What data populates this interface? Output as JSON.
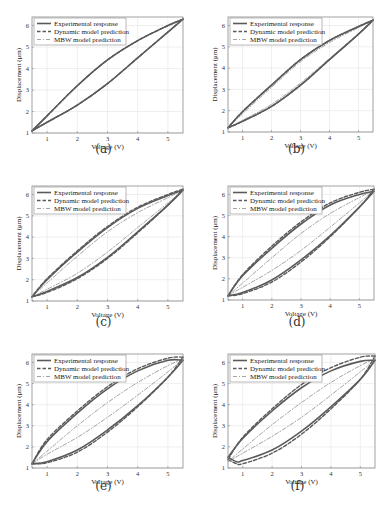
{
  "chart_data": [
    {
      "id": "a",
      "type": "line",
      "caption": "(a)",
      "xlabel": "Voltage (V)",
      "ylabel": "Displacement (μm)",
      "xlim": [
        0.5,
        5.5
      ],
      "ylim": [
        1,
        6.4
      ],
      "xticks": [
        1,
        2,
        3,
        4,
        5
      ],
      "yticks": [
        1,
        2,
        3,
        4,
        5,
        6
      ],
      "grid": true,
      "legend": {
        "position": "top-left",
        "entries": [
          "Experimental response",
          "Dynamic model prediction",
          "MBW model prediction"
        ]
      },
      "series": [
        {
          "name": "Experimental response",
          "style": "solid",
          "ascending": {
            "x": [
              0.5,
              1,
              2,
              3,
              4,
              5,
              5.5
            ],
            "y": [
              1.1,
              1.5,
              2.3,
              3.3,
              4.5,
              5.7,
              6.3
            ]
          },
          "descending": {
            "x": [
              5.5,
              5,
              4,
              3,
              2,
              1,
              0.5
            ],
            "y": [
              6.3,
              6.0,
              5.3,
              4.4,
              3.2,
              1.8,
              1.1
            ]
          }
        },
        {
          "name": "Dynamic model prediction",
          "style": "dashed",
          "ascending": {
            "x": [
              0.5,
              1,
              2,
              3,
              4,
              5,
              5.5
            ],
            "y": [
              1.1,
              1.5,
              2.3,
              3.3,
              4.5,
              5.7,
              6.3
            ]
          },
          "descending": {
            "x": [
              5.5,
              5,
              4,
              3,
              2,
              1,
              0.5
            ],
            "y": [
              6.3,
              6.0,
              5.3,
              4.4,
              3.2,
              1.8,
              1.1
            ]
          }
        },
        {
          "name": "MBW model prediction",
          "style": "dashdot",
          "ascending": {
            "x": [
              0.5,
              1,
              2,
              3,
              4,
              5,
              5.5
            ],
            "y": [
              1.1,
              1.5,
              2.3,
              3.3,
              4.5,
              5.7,
              6.3
            ]
          },
          "descending": {
            "x": [
              5.5,
              5,
              4,
              3,
              2,
              1,
              0.5
            ],
            "y": [
              6.3,
              6.0,
              5.3,
              4.4,
              3.2,
              1.8,
              1.1
            ]
          }
        }
      ]
    },
    {
      "id": "b",
      "type": "line",
      "caption": "(b)",
      "xlabel": "Voltage (V)",
      "ylabel": "Displacement (μm)",
      "xlim": [
        0.5,
        5.5
      ],
      "ylim": [
        1,
        6.4
      ],
      "xticks": [
        1,
        2,
        3,
        4,
        5
      ],
      "yticks": [
        1,
        2,
        3,
        4,
        5,
        6
      ],
      "grid": true,
      "legend": {
        "position": "top-left",
        "entries": [
          "Experimental response",
          "Dynamic model prediction",
          "MBW model prediction"
        ]
      },
      "series": [
        {
          "name": "Experimental response",
          "style": "solid",
          "ascending": {
            "x": [
              0.5,
              1,
              2,
              3,
              4,
              5,
              5.5
            ],
            "y": [
              1.2,
              1.5,
              2.2,
              3.2,
              4.4,
              5.6,
              6.25
            ]
          },
          "descending": {
            "x": [
              5.5,
              5,
              4,
              3,
              2,
              1,
              0.5
            ],
            "y": [
              6.25,
              5.95,
              5.3,
              4.4,
              3.2,
              1.95,
              1.2
            ]
          }
        },
        {
          "name": "Dynamic model prediction",
          "style": "dashed",
          "ascending": {
            "x": [
              0.5,
              1,
              2,
              3,
              4,
              5,
              5.5
            ],
            "y": [
              1.2,
              1.5,
              2.2,
              3.2,
              4.4,
              5.6,
              6.25
            ]
          },
          "descending": {
            "x": [
              5.5,
              5,
              4,
              3,
              2,
              1,
              0.5
            ],
            "y": [
              6.25,
              5.95,
              5.3,
              4.4,
              3.2,
              1.95,
              1.2
            ]
          }
        },
        {
          "name": "MBW model prediction",
          "style": "dashdot",
          "ascending": {
            "x": [
              0.5,
              1,
              2,
              3,
              4,
              5,
              5.5
            ],
            "y": [
              1.2,
              1.55,
              2.3,
              3.3,
              4.45,
              5.6,
              6.25
            ]
          },
          "descending": {
            "x": [
              5.5,
              5,
              4,
              3,
              2,
              1,
              0.5
            ],
            "y": [
              6.25,
              5.9,
              5.2,
              4.3,
              3.1,
              1.85,
              1.2
            ]
          }
        }
      ]
    },
    {
      "id": "c",
      "type": "line",
      "caption": "(c)",
      "xlabel": "Voltage (V)",
      "ylabel": "Displacement (μm)",
      "xlim": [
        0.5,
        5.5
      ],
      "ylim": [
        1,
        6.4
      ],
      "xticks": [
        1,
        2,
        3,
        4,
        5
      ],
      "yticks": [
        1,
        2,
        3,
        4,
        5,
        6
      ],
      "grid": true,
      "legend": {
        "position": "top-left",
        "entries": [
          "Experimental response",
          "Dynamic model prediction",
          "MBW model prediction"
        ]
      },
      "series": [
        {
          "name": "Experimental response",
          "style": "solid",
          "ascending": {
            "x": [
              0.5,
              1,
              2,
              3,
              4,
              5,
              5.5
            ],
            "y": [
              1.2,
              1.45,
              2.1,
              3.05,
              4.25,
              5.5,
              6.2
            ]
          },
          "descending": {
            "x": [
              5.5,
              5,
              4,
              3,
              2,
              1,
              0.5
            ],
            "y": [
              6.2,
              5.95,
              5.35,
              4.45,
              3.3,
              2.0,
              1.2
            ]
          }
        },
        {
          "name": "Dynamic model prediction",
          "style": "dashed",
          "ascending": {
            "x": [
              0.5,
              1,
              2,
              3,
              4,
              5,
              5.5
            ],
            "y": [
              1.2,
              1.4,
              2.05,
              3.0,
              4.2,
              5.5,
              6.25
            ]
          },
          "descending": {
            "x": [
              5.5,
              5,
              4,
              3,
              2,
              1,
              0.5
            ],
            "y": [
              6.25,
              6.0,
              5.4,
              4.5,
              3.35,
              2.05,
              1.2
            ]
          }
        },
        {
          "name": "MBW model prediction",
          "style": "dashdot",
          "ascending": {
            "x": [
              0.5,
              1,
              2,
              3,
              4,
              5,
              5.5
            ],
            "y": [
              1.2,
              1.55,
              2.3,
              3.3,
              4.45,
              5.6,
              6.2
            ]
          },
          "descending": {
            "x": [
              5.5,
              5,
              4,
              3,
              2,
              1,
              0.5
            ],
            "y": [
              6.2,
              5.85,
              5.15,
              4.25,
              3.1,
              1.85,
              1.2
            ]
          }
        }
      ]
    },
    {
      "id": "d",
      "type": "line",
      "caption": "(d)",
      "xlabel": "Voltage (V)",
      "ylabel": "Displacement (μm)",
      "xlim": [
        0.5,
        5.5
      ],
      "ylim": [
        1,
        6.4
      ],
      "xticks": [
        1,
        2,
        3,
        4,
        5
      ],
      "yticks": [
        1,
        2,
        3,
        4,
        5,
        6
      ],
      "grid": true,
      "legend": {
        "position": "top-left",
        "entries": [
          "Experimental response",
          "Dynamic model prediction",
          "MBW model prediction"
        ]
      },
      "series": [
        {
          "name": "Experimental response",
          "style": "solid",
          "ascending": {
            "x": [
              0.5,
              1,
              2,
              3,
              4,
              5,
              5.5
            ],
            "y": [
              1.2,
              1.35,
              1.95,
              2.9,
              4.05,
              5.4,
              6.15
            ]
          },
          "descending": {
            "x": [
              5.5,
              5,
              4,
              3,
              2,
              1,
              0.5
            ],
            "y": [
              6.15,
              6.0,
              5.5,
              4.6,
              3.45,
              2.15,
              1.2
            ]
          }
        },
        {
          "name": "Dynamic model prediction",
          "style": "dashed",
          "ascending": {
            "x": [
              0.5,
              1,
              2,
              3,
              4,
              5,
              5.5
            ],
            "y": [
              1.2,
              1.3,
              1.85,
              2.8,
              4.0,
              5.4,
              6.25
            ]
          },
          "descending": {
            "x": [
              5.5,
              5,
              4,
              3,
              2,
              1,
              0.5
            ],
            "y": [
              6.25,
              6.1,
              5.6,
              4.7,
              3.55,
              2.2,
              1.2
            ]
          }
        },
        {
          "name": "MBW model prediction",
          "style": "dashdot",
          "ascending": {
            "x": [
              0.5,
              1,
              2,
              3,
              4,
              5,
              5.5
            ],
            "y": [
              1.2,
              1.6,
              2.4,
              3.35,
              4.45,
              5.6,
              6.2
            ]
          },
          "descending": {
            "x": [
              5.5,
              5,
              4,
              3,
              2,
              1,
              0.5
            ],
            "y": [
              6.2,
              5.85,
              5.1,
              4.15,
              3.0,
              1.8,
              1.2
            ]
          }
        }
      ]
    },
    {
      "id": "e",
      "type": "line",
      "caption": "(e)",
      "xlabel": "Voltage (V)",
      "ylabel": "Displacement (μm)",
      "xlim": [
        0.5,
        5.5
      ],
      "ylim": [
        1,
        6.4
      ],
      "xticks": [
        1,
        2,
        3,
        4,
        5
      ],
      "yticks": [
        1,
        2,
        3,
        4,
        5,
        6
      ],
      "grid": true,
      "legend": {
        "position": "top-left",
        "entries": [
          "Experimental response",
          "Dynamic model prediction",
          "MBW model prediction"
        ]
      },
      "series": [
        {
          "name": "Experimental response",
          "style": "solid",
          "ascending": {
            "x": [
              0.5,
              1,
              2,
              3,
              4,
              5,
              5.5
            ],
            "y": [
              1.2,
              1.3,
              1.85,
              2.8,
              3.95,
              5.3,
              6.1
            ]
          },
          "descending": {
            "x": [
              5.5,
              5,
              4,
              3,
              2,
              1,
              0.5
            ],
            "y": [
              6.1,
              6.1,
              5.6,
              4.75,
              3.6,
              2.25,
              1.2
            ]
          }
        },
        {
          "name": "Dynamic model prediction",
          "style": "dashed",
          "ascending": {
            "x": [
              0.5,
              1,
              2,
              3,
              4,
              5,
              5.5
            ],
            "y": [
              1.2,
              1.25,
              1.75,
              2.7,
              3.9,
              5.3,
              6.25
            ]
          },
          "descending": {
            "x": [
              5.5,
              5,
              4,
              3,
              2,
              1,
              0.5
            ],
            "y": [
              6.25,
              6.2,
              5.7,
              4.85,
              3.7,
              2.35,
              1.2
            ]
          }
        },
        {
          "name": "MBW model prediction",
          "style": "dashdot",
          "ascending": {
            "x": [
              0.5,
              1,
              2,
              3,
              4,
              5,
              5.5
            ],
            "y": [
              1.2,
              1.65,
              2.45,
              3.4,
              4.45,
              5.55,
              6.15
            ]
          },
          "descending": {
            "x": [
              5.5,
              5,
              4,
              3,
              2,
              1,
              0.5
            ],
            "y": [
              6.15,
              5.85,
              5.05,
              4.1,
              3.0,
              1.8,
              1.2
            ]
          }
        }
      ]
    },
    {
      "id": "f",
      "type": "line",
      "caption": "(f)",
      "xlabel": "Voltage (V)",
      "ylabel": "Displacement (μm)",
      "xlim": [
        0.5,
        5.5
      ],
      "ylim": [
        1,
        6.4
      ],
      "xticks": [
        1,
        2,
        3,
        4,
        5
      ],
      "yticks": [
        1,
        2,
        3,
        4,
        5,
        6
      ],
      "grid": true,
      "legend": {
        "position": "top-left",
        "entries": [
          "Experimental response",
          "Dynamic model prediction",
          "MBW model prediction"
        ]
      },
      "series": [
        {
          "name": "Experimental response",
          "style": "solid",
          "ascending": {
            "x": [
              0.5,
              0.8,
              1,
              2,
              3,
              4,
              5,
              5.5
            ],
            "y": [
              1.5,
              1.3,
              1.35,
              1.85,
              2.75,
              3.9,
              5.2,
              6.1
            ]
          },
          "descending": {
            "x": [
              5.5,
              5,
              4,
              3,
              2,
              1,
              0.5
            ],
            "y": [
              6.1,
              6.05,
              5.6,
              4.8,
              3.7,
              2.4,
              1.5
            ]
          }
        },
        {
          "name": "Dynamic model prediction",
          "style": "dashed",
          "ascending": {
            "x": [
              0.5,
              0.8,
              1,
              2,
              3,
              4,
              5,
              5.5
            ],
            "y": [
              1.4,
              1.2,
              1.2,
              1.7,
              2.6,
              3.8,
              5.2,
              6.3
            ]
          },
          "descending": {
            "x": [
              5.5,
              5,
              4,
              3,
              2,
              1,
              0.5
            ],
            "y": [
              6.3,
              6.25,
              5.75,
              4.95,
              3.8,
              2.45,
              1.4
            ]
          }
        },
        {
          "name": "MBW model prediction",
          "style": "dashdot",
          "ascending": {
            "x": [
              0.5,
              1,
              2,
              3,
              4,
              5,
              5.5
            ],
            "y": [
              1.3,
              1.7,
              2.5,
              3.4,
              4.45,
              5.55,
              6.15
            ]
          },
          "descending": {
            "x": [
              5.5,
              5,
              4,
              3,
              2,
              1,
              0.5
            ],
            "y": [
              6.15,
              5.85,
              5.05,
              4.1,
              3.05,
              1.9,
              1.3
            ]
          }
        }
      ]
    }
  ],
  "colors": {
    "curve": "#5a5a5a",
    "mbw": "#9a9a9a",
    "grid": "#e4e4e4",
    "frame": "#8a8a8a"
  }
}
